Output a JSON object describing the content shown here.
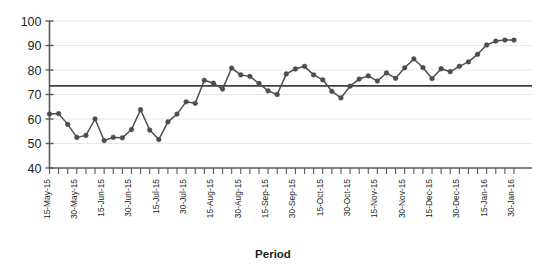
{
  "chart_data": {
    "type": "line",
    "title": "",
    "subtitle": "",
    "xlabel": "Period",
    "ylabel": "",
    "ylim": [
      40,
      100
    ],
    "ytick_values": [
      40,
      50,
      60,
      70,
      80,
      90,
      100
    ],
    "ytick_labels": [
      "40",
      "50",
      "60",
      "70",
      "80",
      "90",
      "100"
    ],
    "grid": true,
    "grid_axis": "y",
    "legend": false,
    "legend_position": "none",
    "marker": "circle",
    "line_color": "#4d4d4d",
    "marker_color": "#4d4d4d",
    "grid_color": "#e8e8e8",
    "axis_color": "#58595b",
    "reference_line": {
      "name": "mean-line",
      "value": 73.5,
      "color": "#3f3f3f",
      "style": "solid"
    },
    "xtick_labels": [
      "15-May-15",
      "30-May-15",
      "15-Jun-15",
      "30-Jun-15",
      "15-Jul-15",
      "30-Jul-15",
      "15-Aug-15",
      "30-Aug-15",
      "15-Sep-15",
      "30-Sep-15",
      "15-Oct-15",
      "30-Oct-15",
      "15-Nov-15",
      "30-Nov-15",
      "15-Dec-15",
      "30-Dec-15",
      "15-Jan-16",
      "30-Jan-16"
    ],
    "xtick_label_interval": 3,
    "n_points": 52,
    "values": [
      62.0,
      62.2,
      57.8,
      52.5,
      53.3,
      60.0,
      51.2,
      52.5,
      52.3,
      55.7,
      63.8,
      55.5,
      51.6,
      58.8,
      62.0,
      67.0,
      66.4,
      75.8,
      74.6,
      72.2,
      80.8,
      78.0,
      77.4,
      74.5,
      71.5,
      70.0,
      78.4,
      80.4,
      81.5,
      78.0,
      76.0,
      71.3,
      68.6,
      73.4,
      76.3,
      77.6,
      75.5,
      78.8,
      76.6,
      80.9,
      84.5,
      81.0,
      76.5,
      80.5,
      79.3,
      81.5,
      83.3,
      86.4,
      90.2,
      91.8,
      92.2,
      92.2
    ]
  }
}
